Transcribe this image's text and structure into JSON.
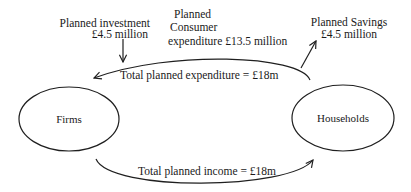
{
  "diagram": {
    "type": "circular-flow-of-income",
    "nodes": [
      {
        "id": "firms",
        "label": "Firms"
      },
      {
        "id": "households",
        "label": "Households"
      }
    ],
    "flows": {
      "expenditure": {
        "label": "Total planned expenditure  = £18m",
        "from": "households",
        "to": "firms"
      },
      "income": {
        "label": "Total planned income = £18m",
        "from": "firms",
        "to": "households"
      }
    },
    "injections": {
      "investment": {
        "line1": "Planned investment",
        "line2": "£4.5 million"
      }
    },
    "withdrawals": {
      "savings": {
        "line1": "Planned  Savings",
        "line2": "£4.5 million"
      }
    },
    "consumer_expenditure": {
      "line1": "Planned",
      "line2": "Consumer",
      "line3": "expenditure  £13.5 million"
    },
    "colors": {
      "line": "#1f1f1f",
      "text": "#1a1a1a",
      "background": "#ffffff"
    }
  }
}
